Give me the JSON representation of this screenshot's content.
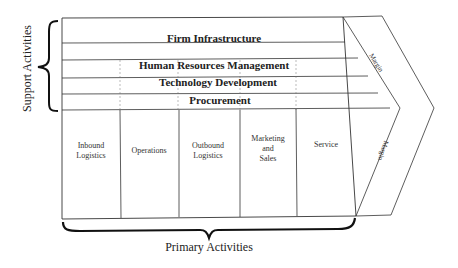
{
  "support_label": "Support Activities",
  "primary_label": "Primary Activities",
  "support_activities": [
    {
      "label": "Firm Infrastructure"
    },
    {
      "label": "Human Resources Management"
    },
    {
      "label": "Technology Development"
    },
    {
      "label": "Procurement"
    }
  ],
  "primary_activities": [
    {
      "line1": "Inbound",
      "line2": "Logistics",
      "line3": ""
    },
    {
      "line1": "Operations",
      "line2": "",
      "line3": ""
    },
    {
      "line1": "Outbound",
      "line2": "Logistics",
      "line3": ""
    },
    {
      "line1": "Marketing",
      "line2": "and",
      "line3": "Sales"
    },
    {
      "line1": "Service",
      "line2": "",
      "line3": ""
    }
  ],
  "margin": {
    "upper": "Margin",
    "lower": "Margin"
  },
  "colors": {
    "line": "#333333",
    "brace": "#111111",
    "background": "#ffffff"
  }
}
